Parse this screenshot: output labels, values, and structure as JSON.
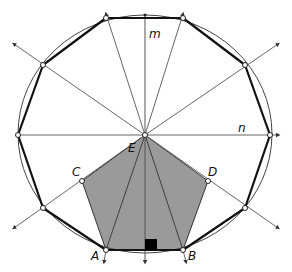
{
  "diagram": {
    "labels": {
      "m": "m",
      "n": "n",
      "E": "E",
      "C": "C",
      "D": "D",
      "A": "A",
      "B": "B"
    },
    "colors": {
      "pentagon_fill": "#9a9a9a",
      "stroke": "#111111",
      "thin_line": "#555555",
      "right_angle_marker": "#000000",
      "background": "#ffffff"
    },
    "shapes": {
      "circle": "circumscribed circle",
      "decagon": "regular decagon (bold edges)",
      "pentagon": "shaded pentagon A-B-D-E-C",
      "lines": [
        "line m (vertical axis of symmetry)",
        "line n (horizontal diameter)",
        "radial rays through decagon vertices"
      ],
      "marker": "right-angle square at midpoint of AB"
    }
  }
}
